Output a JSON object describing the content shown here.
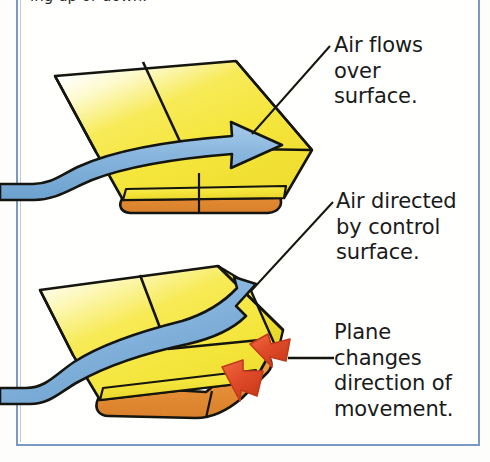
{
  "figure": {
    "title_cutoff": "ing up or down.",
    "frame_color": "#7a98c4",
    "background_color": "#fffffd"
  },
  "palette": {
    "wing_yellow": "#f5e63c",
    "wing_yellow_light": "#fbf6a8",
    "wing_yellow_deep": "#e8d52a",
    "leading_edge_orange": "#e8923a",
    "leading_edge_orange_dark": "#d97f27",
    "airflow_blue": "#86b4dd",
    "airflow_blue_dark": "#5f95c4",
    "force_red": "#e04b2a",
    "force_red_dark": "#c23a1c",
    "outline_black": "#15150f",
    "leader_line": "#15150f",
    "text_color": "#1a1a1a"
  },
  "callouts": [
    {
      "id": "air-flows-over-surface",
      "text": "Air flows\nover\nsurface.",
      "lines": [
        "Air flows",
        "over",
        "surface."
      ],
      "leader": {
        "from_x": 330,
        "from_y": 46,
        "to_x": 252,
        "to_y": 134,
        "type": "diagonal"
      }
    },
    {
      "id": "air-directed-by-control-surface",
      "text": "Air directed\nby control\nsurface.",
      "lines": [
        "Air directed",
        "by control",
        "surface."
      ],
      "leader": {
        "from_x": 333,
        "from_y": 202,
        "to_x": 251,
        "to_y": 291,
        "type": "diagonal"
      }
    },
    {
      "id": "plane-changes-direction-of-movement",
      "text": "Plane\nchanges\ndirection of\nmovement.",
      "lines": [
        "Plane",
        "changes",
        "direction of",
        "movement."
      ],
      "leader": {
        "from_x": 334,
        "from_y": 358,
        "to_x": 288,
        "to_y": 358,
        "type": "horizontal"
      }
    }
  ],
  "diagrams": [
    {
      "id": "wing-neutral",
      "label": "upper-wing-neutral-control-surface",
      "airflow_arrow": "straight-over-surface",
      "force_arrows": []
    },
    {
      "id": "wing-deflected",
      "label": "lower-wing-deflected-control-surface",
      "airflow_arrow": "deflected-upward",
      "force_arrows": [
        "red-arrow-upper",
        "red-arrow-lower"
      ]
    }
  ]
}
